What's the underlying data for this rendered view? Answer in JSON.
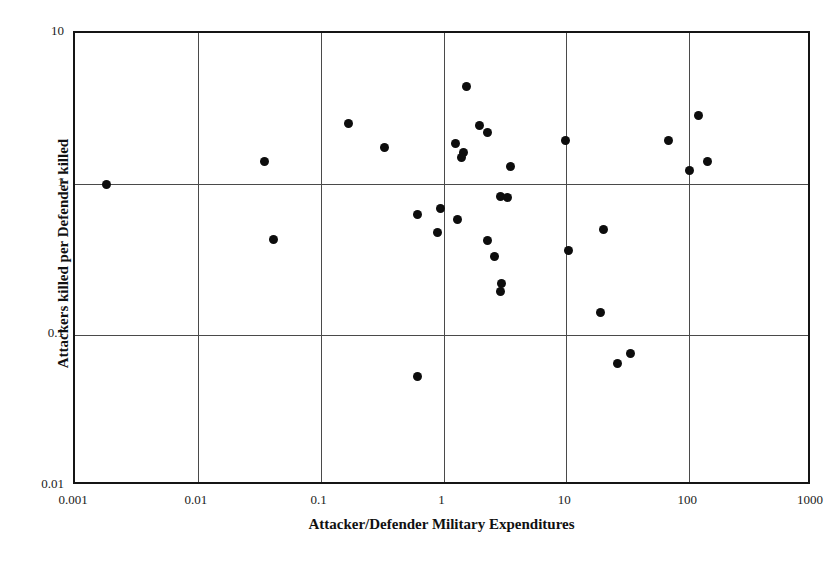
{
  "chart_data": {
    "type": "scatter",
    "title": "",
    "xlabel": "Attacker/Defender Military Expenditures",
    "ylabel": "Attackers killed per Defender killed",
    "xscale": "log",
    "yscale": "log",
    "xlim": [
      0.001,
      1000
    ],
    "ylim": [
      0.01,
      10
    ],
    "grid": true,
    "legend": null,
    "xticks": [
      "0.001",
      "0.01",
      "0.1",
      "1",
      "10",
      "100",
      "1000"
    ],
    "xtick_values": [
      0.001,
      0.01,
      0.1,
      1,
      10,
      100,
      1000
    ],
    "yticks": [
      "0.01",
      "0.1",
      "1",
      "10"
    ],
    "ytick_values": [
      0.01,
      0.1,
      1,
      10
    ],
    "marker": "filled-circle",
    "marker_color": "#0d0d0d",
    "points": [
      {
        "x": 0.0018,
        "y": 1.0
      },
      {
        "x": 0.035,
        "y": 1.4
      },
      {
        "x": 0.041,
        "y": 0.43
      },
      {
        "x": 0.17,
        "y": 2.5
      },
      {
        "x": 0.33,
        "y": 1.75
      },
      {
        "x": 0.62,
        "y": 0.053
      },
      {
        "x": 0.62,
        "y": 0.63
      },
      {
        "x": 0.95,
        "y": 0.69
      },
      {
        "x": 0.9,
        "y": 0.48
      },
      {
        "x": 1.25,
        "y": 1.85
      },
      {
        "x": 1.45,
        "y": 1.62
      },
      {
        "x": 1.4,
        "y": 1.5
      },
      {
        "x": 1.3,
        "y": 0.58
      },
      {
        "x": 1.55,
        "y": 4.4
      },
      {
        "x": 1.95,
        "y": 2.45
      },
      {
        "x": 2.3,
        "y": 2.2
      },
      {
        "x": 2.3,
        "y": 0.42
      },
      {
        "x": 2.6,
        "y": 0.33
      },
      {
        "x": 2.95,
        "y": 0.22
      },
      {
        "x": 2.9,
        "y": 0.195
      },
      {
        "x": 3.5,
        "y": 1.3
      },
      {
        "x": 2.9,
        "y": 0.83
      },
      {
        "x": 3.3,
        "y": 0.81
      },
      {
        "x": 9.8,
        "y": 1.95
      },
      {
        "x": 10.5,
        "y": 0.36
      },
      {
        "x": 20.0,
        "y": 0.5
      },
      {
        "x": 19.0,
        "y": 0.14
      },
      {
        "x": 26.0,
        "y": 0.065
      },
      {
        "x": 33.0,
        "y": 0.075
      },
      {
        "x": 68.0,
        "y": 1.95
      },
      {
        "x": 100.0,
        "y": 1.22
      },
      {
        "x": 120.0,
        "y": 2.85
      },
      {
        "x": 140.0,
        "y": 1.4
      }
    ]
  },
  "axes": {
    "x_title": "Attacker/Defender Military Expenditures",
    "y_title": "Attackers killed per Defender killed"
  }
}
